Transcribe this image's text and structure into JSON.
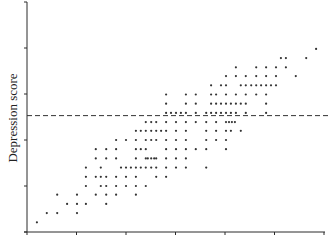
{
  "chart_data": {
    "type": "scatter",
    "title": "",
    "xlabel": "",
    "ylabel": "Depression score",
    "xlim": [
      0,
      6
    ],
    "ylim": [
      0,
      5
    ],
    "xticks": [
      0,
      1,
      2,
      3,
      4,
      5,
      6
    ],
    "yticks": [
      0,
      1,
      2,
      3,
      4,
      5
    ],
    "xtick_labels": [],
    "ytick_labels": [],
    "grid": false,
    "legend": null,
    "reference_line": {
      "orientation": "horizontal",
      "y": 2.53,
      "style": "dashed"
    },
    "points": [
      [
        0.2,
        0.21
      ],
      [
        0.4,
        0.41
      ],
      [
        0.61,
        0.41
      ],
      [
        1.01,
        0.41
      ],
      [
        0.81,
        0.61
      ],
      [
        1.01,
        0.61
      ],
      [
        1.19,
        0.61
      ],
      [
        1.6,
        0.61
      ],
      [
        0.61,
        0.81
      ],
      [
        1.01,
        0.81
      ],
      [
        1.39,
        0.81
      ],
      [
        1.6,
        0.81
      ],
      [
        1.8,
        0.81
      ],
      [
        2.2,
        0.81
      ],
      [
        1.19,
        1.0
      ],
      [
        1.49,
        1.0
      ],
      [
        1.6,
        1.0
      ],
      [
        1.8,
        1.0
      ],
      [
        2.0,
        1.0
      ],
      [
        2.2,
        1.0
      ],
      [
        2.4,
        1.0
      ],
      [
        1.19,
        1.2
      ],
      [
        1.39,
        1.2
      ],
      [
        1.49,
        1.2
      ],
      [
        1.6,
        1.2
      ],
      [
        1.8,
        1.2
      ],
      [
        2.0,
        1.2
      ],
      [
        2.2,
        1.2
      ],
      [
        2.61,
        1.2
      ],
      [
        2.81,
        1.2
      ],
      [
        1.19,
        1.4
      ],
      [
        1.49,
        1.4
      ],
      [
        1.9,
        1.4
      ],
      [
        2.0,
        1.4
      ],
      [
        2.1,
        1.4
      ],
      [
        2.2,
        1.4
      ],
      [
        2.3,
        1.4
      ],
      [
        2.4,
        1.4
      ],
      [
        2.51,
        1.4
      ],
      [
        2.61,
        1.4
      ],
      [
        2.81,
        1.4
      ],
      [
        3.01,
        1.4
      ],
      [
        3.21,
        1.4
      ],
      [
        3.62,
        1.4
      ],
      [
        1.39,
        1.6
      ],
      [
        1.6,
        1.6
      ],
      [
        1.8,
        1.6
      ],
      [
        2.2,
        1.6
      ],
      [
        2.4,
        1.6
      ],
      [
        2.44,
        1.6
      ],
      [
        2.51,
        1.6
      ],
      [
        2.57,
        1.6
      ],
      [
        2.61,
        1.6
      ],
      [
        2.81,
        1.6
      ],
      [
        3.01,
        1.6
      ],
      [
        3.21,
        1.6
      ],
      [
        1.39,
        1.8
      ],
      [
        1.6,
        1.8
      ],
      [
        1.8,
        1.8
      ],
      [
        2.2,
        1.8
      ],
      [
        2.3,
        1.8
      ],
      [
        2.4,
        1.8
      ],
      [
        2.81,
        1.8
      ],
      [
        3.01,
        1.8
      ],
      [
        3.21,
        1.8
      ],
      [
        3.41,
        1.8
      ],
      [
        3.62,
        1.8
      ],
      [
        4.02,
        1.8
      ],
      [
        1.8,
        2.0
      ],
      [
        2.0,
        2.0
      ],
      [
        2.2,
        2.0
      ],
      [
        2.4,
        2.0
      ],
      [
        2.51,
        2.0
      ],
      [
        2.61,
        2.0
      ],
      [
        2.81,
        2.0
      ],
      [
        3.01,
        2.0
      ],
      [
        3.21,
        2.0
      ],
      [
        3.62,
        2.0
      ],
      [
        3.82,
        2.0
      ],
      [
        4.02,
        2.0
      ],
      [
        2.2,
        2.2
      ],
      [
        2.3,
        2.2
      ],
      [
        2.4,
        2.2
      ],
      [
        2.51,
        2.2
      ],
      [
        2.61,
        2.2
      ],
      [
        2.71,
        2.2
      ],
      [
        2.81,
        2.2
      ],
      [
        3.01,
        2.2
      ],
      [
        3.21,
        2.2
      ],
      [
        3.62,
        2.2
      ],
      [
        3.82,
        2.2
      ],
      [
        4.02,
        2.2
      ],
      [
        4.12,
        2.2
      ],
      [
        4.32,
        2.2
      ],
      [
        2.4,
        2.39
      ],
      [
        2.51,
        2.39
      ],
      [
        2.61,
        2.39
      ],
      [
        2.81,
        2.39
      ],
      [
        3.01,
        2.39
      ],
      [
        3.21,
        2.39
      ],
      [
        3.41,
        2.39
      ],
      [
        3.62,
        2.39
      ],
      [
        3.82,
        2.39
      ],
      [
        4.02,
        2.39
      ],
      [
        4.08,
        2.39
      ],
      [
        4.14,
        2.39
      ],
      [
        4.2,
        2.39
      ],
      [
        2.81,
        2.59
      ],
      [
        2.91,
        2.59
      ],
      [
        3.01,
        2.59
      ],
      [
        3.11,
        2.59
      ],
      [
        3.21,
        2.59
      ],
      [
        3.41,
        2.59
      ],
      [
        3.62,
        2.59
      ],
      [
        3.72,
        2.59
      ],
      [
        3.82,
        2.59
      ],
      [
        3.92,
        2.59
      ],
      [
        4.02,
        2.59
      ],
      [
        4.12,
        2.59
      ],
      [
        4.22,
        2.59
      ],
      [
        4.42,
        2.59
      ],
      [
        4.83,
        2.59
      ],
      [
        2.81,
        2.79
      ],
      [
        3.21,
        2.79
      ],
      [
        3.41,
        2.79
      ],
      [
        3.72,
        2.79
      ],
      [
        3.82,
        2.79
      ],
      [
        3.92,
        2.79
      ],
      [
        4.02,
        2.79
      ],
      [
        4.12,
        2.79
      ],
      [
        4.22,
        2.79
      ],
      [
        4.32,
        2.79
      ],
      [
        4.42,
        2.79
      ],
      [
        4.83,
        2.79
      ],
      [
        2.81,
        2.99
      ],
      [
        3.21,
        2.99
      ],
      [
        3.41,
        2.99
      ],
      [
        3.72,
        2.99
      ],
      [
        3.82,
        2.99
      ],
      [
        4.02,
        2.99
      ],
      [
        4.22,
        2.99
      ],
      [
        4.42,
        2.99
      ],
      [
        4.63,
        2.99
      ],
      [
        4.83,
        2.99
      ],
      [
        3.72,
        3.19
      ],
      [
        3.92,
        3.19
      ],
      [
        4.02,
        3.19
      ],
      [
        4.32,
        3.19
      ],
      [
        4.42,
        3.19
      ],
      [
        4.53,
        3.19
      ],
      [
        4.63,
        3.19
      ],
      [
        4.73,
        3.19
      ],
      [
        4.83,
        3.19
      ],
      [
        4.93,
        3.19
      ],
      [
        5.03,
        3.19
      ],
      [
        4.02,
        3.39
      ],
      [
        4.22,
        3.39
      ],
      [
        4.42,
        3.39
      ],
      [
        4.63,
        3.39
      ],
      [
        4.83,
        3.39
      ],
      [
        5.03,
        3.39
      ],
      [
        5.43,
        3.39
      ],
      [
        4.22,
        3.58
      ],
      [
        4.63,
        3.58
      ],
      [
        4.83,
        3.58
      ],
      [
        5.03,
        3.58
      ],
      [
        5.23,
        3.58
      ],
      [
        5.13,
        3.78
      ],
      [
        5.23,
        3.78
      ],
      [
        5.64,
        3.78
      ],
      [
        5.84,
        3.98
      ]
    ]
  }
}
